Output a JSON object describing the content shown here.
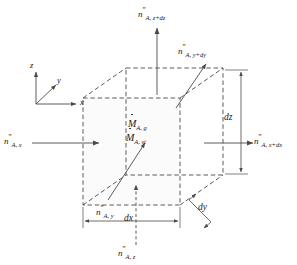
{
  "figure": {
    "background_color": "#ffffff",
    "line_color": "#4a4a4a",
    "text_color": "#1a1a1a",
    "face_fill": "#fbfbfb"
  },
  "axes": {
    "z": "z",
    "y": "y",
    "x": "x"
  },
  "fluxes": {
    "top": {
      "base": "n",
      "primes": "″",
      "sub": "A, z+dz"
    },
    "bottom": {
      "base": "n",
      "primes": "″",
      "sub": "A, z"
    },
    "left": {
      "base": "n",
      "primes": "″",
      "sub": "A, x"
    },
    "right": {
      "base": "n",
      "primes": "″",
      "sub": "A, x+dx"
    },
    "back": {
      "base": "n",
      "primes": "″",
      "sub": "A, y+dy"
    },
    "front": {
      "base": "n",
      "primes": "″",
      "sub": "A, y"
    }
  },
  "volume_terms": {
    "generation": {
      "base": "M",
      "sub": "A, g"
    },
    "storage": {
      "base": "M",
      "sub": "A, st"
    }
  },
  "dimensions": {
    "dx": "dx",
    "dy": "dy",
    "dz": "dz"
  }
}
